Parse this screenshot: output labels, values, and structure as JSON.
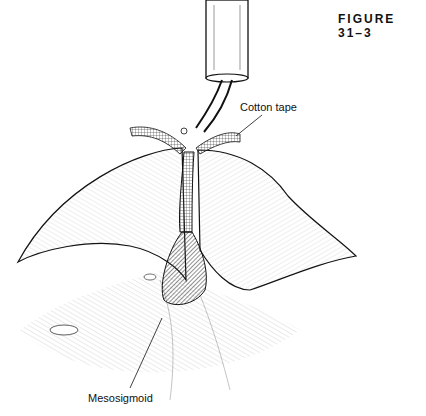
{
  "figure": {
    "title": "FIGURE 31–3",
    "labels": {
      "cotton_tape": "Cotton tape",
      "mesosigmoid": "Mesosigmoid"
    }
  },
  "colors": {
    "ink": "#111111",
    "background": "#ffffff",
    "shade": "#444444"
  }
}
